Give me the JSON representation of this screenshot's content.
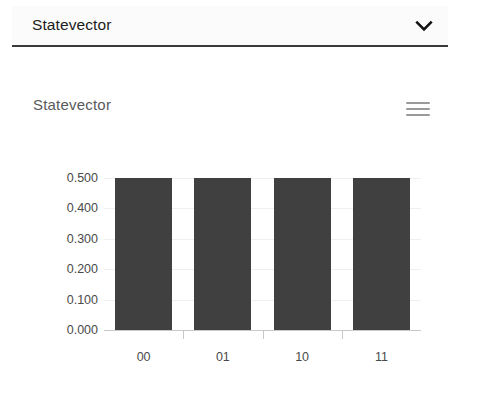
{
  "select": {
    "value": "Statevector",
    "chevron_icon": "chevron-down-icon",
    "options": [
      "Statevector"
    ]
  },
  "chart_panel": {
    "title": "Statevector",
    "menu_icon": "hamburger-menu-icon"
  },
  "chart_data": {
    "type": "bar",
    "title": "Statevector",
    "categories": [
      "00",
      "01",
      "10",
      "11"
    ],
    "values": [
      0.5,
      0.5,
      0.5,
      0.5
    ],
    "series": [
      {
        "name": "Statevector",
        "values": [
          0.5,
          0.5,
          0.5,
          0.5
        ]
      }
    ],
    "xlabel": "",
    "ylabel": "",
    "ylim": [
      0.0,
      0.5
    ],
    "yticks": [
      "0.000",
      "0.100",
      "0.200",
      "0.300",
      "0.400",
      "0.500"
    ],
    "ytick_values": [
      0.0,
      0.1,
      0.2,
      0.3,
      0.4,
      0.5
    ],
    "grid": true,
    "legend": "none",
    "bar_color": "#404040",
    "gridline_color": "#efefef",
    "axis_color": "#c8c8c8"
  }
}
